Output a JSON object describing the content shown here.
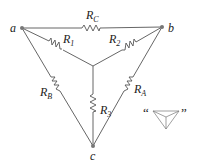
{
  "diagram": {
    "nodes": {
      "a": "a",
      "b": "b",
      "c": "c"
    },
    "resistors": {
      "RC": {
        "main": "R",
        "sub": "C"
      },
      "R1": {
        "main": "R",
        "sub": "1"
      },
      "R2": {
        "main": "R",
        "sub": "2"
      },
      "RB": {
        "main": "R",
        "sub": "B"
      },
      "R3": {
        "main": "R",
        "sub": "3"
      },
      "RA": {
        "main": "R",
        "sub": "A"
      }
    },
    "legend": {
      "open_quote": "“",
      "close_quote": "”"
    },
    "colors": {
      "wire": "#555555",
      "node": "#777777"
    }
  }
}
